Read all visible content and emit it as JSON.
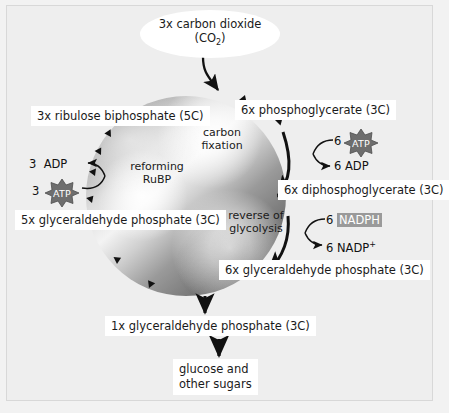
{
  "diagram": {
    "colors": {
      "background": "#f2f2f2",
      "frame": "#eeeeee",
      "box_fill": "#ffffff",
      "text": "#1a1a1a",
      "arrow": "#111111",
      "star_fill": "#6e6e6e",
      "nadph_highlight": "#9a9a9a"
    },
    "input": {
      "line1": "3x carbon dioxide",
      "line2_prefix": "(CO",
      "line2_sub": "2",
      "line2_suffix": ")"
    },
    "cycle_nodes": [
      {
        "id": "rubp",
        "label": "3x ribulose biphosphate (5C)"
      },
      {
        "id": "pga",
        "label": "6x phosphoglycerate (3C)"
      },
      {
        "id": "dpga",
        "label": "6x diphosphoglycerate (3C)"
      },
      {
        "id": "gp6",
        "label": "6x glyceraldehyde phosphate (3C)"
      },
      {
        "id": "gp5",
        "label": "5x glyceraldehyde phosphate (3C)"
      }
    ],
    "inner_labels": [
      {
        "id": "carbon-fixation",
        "line1": "carbon",
        "line2": "fixation"
      },
      {
        "id": "reforming-rubp",
        "line1": "reforming",
        "line2": "RuBP"
      },
      {
        "id": "reverse-glycolysis",
        "line1": "reverse of",
        "line2": "glycolysis"
      }
    ],
    "cofactors": {
      "right_atp": {
        "in_count": "6",
        "in_label": "ATP",
        "out_count": "6",
        "out_label": "ADP"
      },
      "right_nadph": {
        "in_count": "6",
        "in_label": "NADPH",
        "out_count": "6",
        "out_label_base": "NADP",
        "out_label_sup": "+"
      },
      "left_atp": {
        "in_count": "3",
        "in_label": "ATP",
        "out_count": "3",
        "out_label": "ADP"
      }
    },
    "outputs": [
      {
        "id": "gp1",
        "label": "1x glyceraldehyde phosphate (3C)"
      },
      {
        "id": "glucose",
        "line1": "glucose and",
        "line2": "other sugars"
      }
    ]
  }
}
